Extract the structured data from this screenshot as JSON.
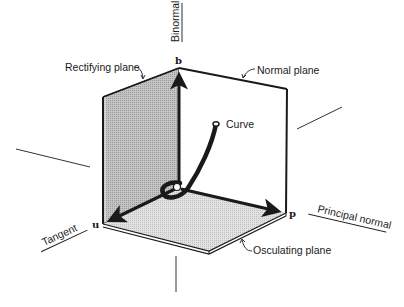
{
  "diagram": {
    "type": "moving-trihedron",
    "axes": {
      "binormal": {
        "label": "Binormal",
        "vector": "b"
      },
      "tangent": {
        "label": "Tangent",
        "vector": "u"
      },
      "principal_normal": {
        "label": "Principal normal",
        "vector": "p"
      }
    },
    "planes": {
      "rectifying": {
        "label": "Rectifying plane",
        "fill": "#bdbdbd"
      },
      "normal": {
        "label": "Normal plane",
        "fill": "#ffffff"
      },
      "osculating": {
        "label": "Osculating plane",
        "fill": "#dcdcdc"
      }
    },
    "curve": {
      "label": "Curve"
    },
    "colors": {
      "ink": "#1a1a1a",
      "background": "#ffffff",
      "rectifying_fill": "#bdbdbd",
      "osculating_fill": "#dcdcdc"
    }
  }
}
